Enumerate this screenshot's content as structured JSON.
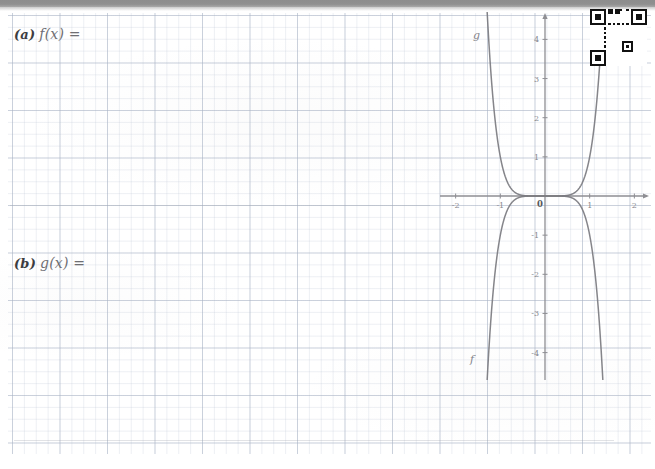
{
  "worksheet": {
    "paper": "graph-grid",
    "items": [
      {
        "id": "a",
        "part_label": "(a)",
        "expression": "f(x) ="
      },
      {
        "id": "b",
        "part_label": "(b)",
        "expression": "g(x) ="
      }
    ]
  },
  "qr_code": {
    "name": "qr-code",
    "modules": 25,
    "dark_color": "#111111",
    "light_color": "#ffffff"
  },
  "chart_data": {
    "type": "line",
    "title": "",
    "xlabel": "",
    "ylabel": "",
    "xlim": [
      -2.35,
      2.35
    ],
    "ylim": [
      -4.7,
      4.7
    ],
    "grid": true,
    "axis_color": "#8e8e93",
    "curve_color": "#7b7b80",
    "x_ticks": [
      -2,
      -1,
      0,
      1,
      2
    ],
    "x_tick_labels": [
      "-2",
      "-1",
      "0",
      "1",
      "2"
    ],
    "y_ticks": [
      -4,
      -3,
      -2,
      -1,
      1,
      2,
      3,
      4
    ],
    "y_tick_labels": [
      "-4",
      "-3",
      "-2",
      "-1",
      "1",
      "2",
      "3",
      "4"
    ],
    "origin_label": "0",
    "series": [
      {
        "name": "g",
        "label": "g",
        "annotation": "g",
        "equation": "y = x^6",
        "exponent": 6,
        "sign": 1,
        "x": [
          -1.72,
          -1.6,
          -1.5,
          -1.4,
          -1.3,
          -1.2,
          -1.1,
          -1.0,
          -0.9,
          -0.8,
          -0.6,
          -0.4,
          -0.2,
          0.0,
          0.2,
          0.4,
          0.6,
          0.8,
          0.9,
          1.0,
          1.1,
          1.2,
          1.3,
          1.4,
          1.5,
          1.6,
          1.72
        ],
        "y": [
          25.9,
          16.8,
          11.4,
          7.53,
          4.83,
          2.99,
          1.77,
          1.0,
          0.53,
          0.26,
          0.047,
          0.0041,
          6.4e-05,
          0.0,
          6.4e-05,
          0.0041,
          0.047,
          0.26,
          0.53,
          1.0,
          1.77,
          2.99,
          4.83,
          7.53,
          11.4,
          16.8,
          25.9
        ]
      },
      {
        "name": "f",
        "label": "f",
        "annotation": "f",
        "equation": "y = -x^6",
        "exponent": 6,
        "sign": -1,
        "x": [
          -1.72,
          -1.6,
          -1.5,
          -1.4,
          -1.3,
          -1.2,
          -1.1,
          -1.0,
          -0.9,
          -0.8,
          -0.6,
          -0.4,
          -0.2,
          0.0,
          0.2,
          0.4,
          0.6,
          0.8,
          0.9,
          1.0,
          1.1,
          1.2,
          1.3,
          1.4,
          1.5,
          1.6,
          1.72
        ],
        "y": [
          -25.9,
          -16.8,
          -11.4,
          -7.53,
          -4.83,
          -2.99,
          -1.77,
          -1.0,
          -0.53,
          -0.26,
          -0.047,
          -0.0041,
          -6.4e-05,
          0.0,
          -6.4e-05,
          -0.0041,
          -0.047,
          -0.26,
          -0.53,
          -1.0,
          -1.77,
          -2.99,
          -4.83,
          -7.53,
          -11.4,
          -16.8,
          -25.9
        ]
      }
    ],
    "annotations": [
      {
        "text": "g",
        "x": -1.63,
        "y": 4.45
      },
      {
        "text": "f",
        "x": -1.55,
        "y": -4.35
      }
    ]
  }
}
